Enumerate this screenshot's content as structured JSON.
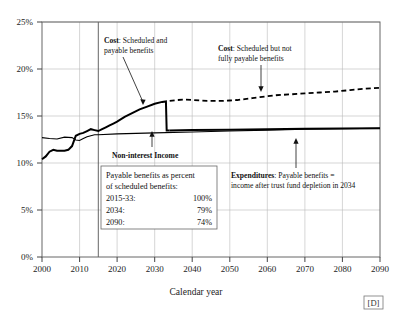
{
  "figure": {
    "source_marker": "[D]"
  },
  "chart_data": {
    "type": "line",
    "title": "",
    "xlabel": "Calendar year",
    "ylabel": "",
    "xlim": [
      2000,
      2090
    ],
    "ylim": [
      0,
      25
    ],
    "grid": true,
    "legend_position": "annotations-inline",
    "y_tick_labels": [
      "0%",
      "5%",
      "10%",
      "15%",
      "20%",
      "25%"
    ],
    "y_ticks": [
      0,
      5,
      10,
      15,
      20,
      25
    ],
    "x_tick_labels": [
      "2000",
      "2010",
      "2020",
      "2030",
      "2040",
      "2050",
      "2060",
      "2070",
      "2080",
      "2090"
    ],
    "x_ticks": [
      2000,
      2010,
      2020,
      2030,
      2040,
      2050,
      2060,
      2070,
      2080,
      2090
    ],
    "historical_projection_divider_year": 2015,
    "trust_fund_depletion_year": 2034,
    "series": [
      {
        "name": "Cost: Scheduled and payable benefits",
        "style": "solid-thick",
        "color": "#000000",
        "x": [
          2000,
          2001,
          2002,
          2003,
          2004,
          2005,
          2006,
          2007,
          2008,
          2009,
          2010,
          2011,
          2012,
          2013,
          2014,
          2015,
          2016,
          2017,
          2018,
          2019,
          2020,
          2022,
          2024,
          2026,
          2028,
          2030,
          2032,
          2033,
          2033.2,
          2034
        ],
        "values": [
          10.4,
          10.7,
          11.2,
          11.4,
          11.3,
          11.3,
          11.3,
          11.4,
          11.8,
          12.9,
          13.1,
          13.2,
          13.4,
          13.6,
          13.5,
          13.4,
          13.6,
          13.8,
          14.0,
          14.2,
          14.4,
          14.9,
          15.3,
          15.7,
          16.0,
          16.3,
          16.5,
          16.55,
          13.45,
          13.45
        ]
      },
      {
        "name": "Cost: Scheduled but not fully payable benefits",
        "style": "dashed",
        "color": "#000000",
        "x": [
          2034,
          2036,
          2038,
          2040,
          2042,
          2044,
          2046,
          2048,
          2050,
          2052,
          2054,
          2056,
          2058,
          2060,
          2062,
          2064,
          2066,
          2068,
          2070,
          2074,
          2078,
          2082,
          2086,
          2090
        ],
        "values": [
          16.6,
          16.7,
          16.75,
          16.7,
          16.65,
          16.6,
          16.6,
          16.6,
          16.65,
          16.7,
          16.8,
          16.9,
          17.0,
          17.1,
          17.2,
          17.25,
          17.3,
          17.35,
          17.4,
          17.5,
          17.6,
          17.75,
          17.9,
          18.0
        ]
      },
      {
        "name": "Non-interest Income",
        "style": "solid-thin",
        "color": "#000000",
        "x": [
          2000,
          2002,
          2004,
          2006,
          2008,
          2009,
          2010,
          2011,
          2012,
          2013,
          2014,
          2015,
          2020,
          2030,
          2040,
          2050,
          2060,
          2070,
          2080,
          2090
        ],
        "values": [
          12.7,
          12.6,
          12.55,
          12.75,
          12.7,
          12.45,
          12.4,
          12.6,
          12.8,
          12.9,
          13.0,
          13.0,
          13.1,
          13.2,
          13.3,
          13.4,
          13.5,
          13.6,
          13.65,
          13.7
        ]
      },
      {
        "name": "Expenditures: Payable benefits",
        "style": "solid-thick",
        "color": "#000000",
        "x": [
          2034,
          2040,
          2050,
          2060,
          2070,
          2080,
          2090
        ],
        "values": [
          13.45,
          13.5,
          13.55,
          13.6,
          13.65,
          13.68,
          13.7
        ]
      }
    ],
    "annotations": [
      {
        "name": "cost-scheduled-payable",
        "bold_prefix": "Cost",
        "text_line1": ": Scheduled and",
        "text_line2": "payable benefits",
        "points_to_year": 2028,
        "points_to_value": 16.0
      },
      {
        "name": "cost-scheduled-not-payable",
        "bold_prefix": "Cost",
        "text_line1": ":  Scheduled but not",
        "text_line2": "fully payable benefits",
        "points_to_year": 2057,
        "points_to_value": 16.9
      },
      {
        "name": "non-interest-income",
        "bold_prefix": "Non-interest Income",
        "text_line1": "",
        "text_line2": "",
        "points_to_year": 2029,
        "points_to_value": 13.2
      },
      {
        "name": "expenditures",
        "bold_prefix": "Expenditures",
        "text_line1": ": Payable benefits =",
        "text_line2": "income after trust fund depletion in 2034",
        "points_to_year": 2067,
        "points_to_value": 13.6
      }
    ],
    "legend_box": {
      "heading_line1": "Payable benefits as percent",
      "heading_line2": "of scheduled benefits:",
      "rows": [
        {
          "period": "2015-33:",
          "percent": "100%"
        },
        {
          "period": "2034:",
          "percent": "79%"
        },
        {
          "period": "2090:",
          "percent": "74%"
        }
      ]
    }
  }
}
